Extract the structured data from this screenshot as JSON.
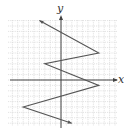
{
  "chart_data": {
    "type": "line",
    "title": "",
    "xlabel": "x",
    "ylabel": "y",
    "grid": true,
    "xlim": [
      -10,
      10
    ],
    "ylim": [
      -8,
      11
    ],
    "series": [
      {
        "name": "zigzag",
        "arrows": "both-ends",
        "points": [
          [
            -4,
            11
          ],
          [
            7,
            5
          ],
          [
            -3,
            3
          ],
          [
            7,
            -1
          ],
          [
            -7,
            -5
          ],
          [
            2,
            -8
          ]
        ]
      }
    ]
  },
  "labels": {
    "x": "x",
    "y": "y"
  },
  "colors": {
    "line": "#555555",
    "axis": "#444444",
    "grid": "#cfcfcf"
  }
}
